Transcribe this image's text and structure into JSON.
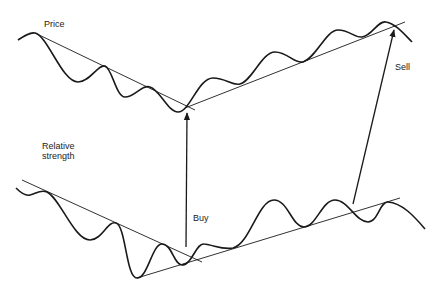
{
  "diagram": {
    "labels": {
      "price": "Price",
      "relative_strength_line1": "Relative",
      "relative_strength_line2": "strength",
      "buy": "Buy",
      "sell": "Sell"
    },
    "colors": {
      "line": "#1a1a1a",
      "background": "#ffffff"
    },
    "price_panel": {
      "curve_points": [
        [
          18,
          40
        ],
        [
          35,
          33
        ],
        [
          78,
          82
        ],
        [
          105,
          66
        ],
        [
          125,
          97
        ],
        [
          150,
          87
        ],
        [
          178,
          112
        ],
        [
          213,
          78
        ],
        [
          240,
          84
        ],
        [
          275,
          52
        ],
        [
          303,
          62
        ],
        [
          338,
          30
        ],
        [
          362,
          37
        ],
        [
          386,
          22
        ],
        [
          412,
          42
        ]
      ],
      "downtrend_line": [
        [
          35,
          33
        ],
        [
          195,
          110
        ]
      ],
      "uptrend_line": [
        [
          185,
          108
        ],
        [
          405,
          22
        ]
      ]
    },
    "relative_strength_panel": {
      "curve_points": [
        [
          16,
          188
        ],
        [
          30,
          195
        ],
        [
          47,
          192
        ],
        [
          90,
          240
        ],
        [
          116,
          223
        ],
        [
          137,
          278
        ],
        [
          162,
          244
        ],
        [
          182,
          265
        ],
        [
          204,
          244
        ],
        [
          233,
          248
        ],
        [
          274,
          200
        ],
        [
          304,
          227
        ],
        [
          335,
          200
        ],
        [
          368,
          222
        ],
        [
          388,
          202
        ],
        [
          425,
          229
        ]
      ],
      "downtrend_line": [
        [
          22,
          180
        ],
        [
          202,
          262
        ]
      ],
      "uptrend_line": [
        [
          137,
          278
        ],
        [
          400,
          198
        ]
      ]
    },
    "signals": [
      {
        "name": "Buy",
        "from": [
          186,
          247
        ],
        "to": [
          187,
          112
        ]
      },
      {
        "name": "Sell",
        "from": [
          353,
          204
        ],
        "to": [
          395,
          28
        ]
      }
    ]
  }
}
